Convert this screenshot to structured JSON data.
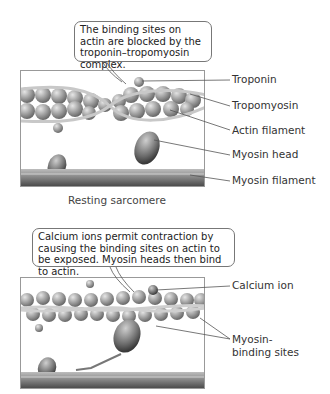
{
  "panels": [
    {
      "bubble_text": "The binding sites on actin are blocked by the troponin–tropomyosin complex.",
      "caption": "Resting sarcomere",
      "labels": [
        "Troponin",
        "Tropomyosin",
        "Actin filament",
        "Myosin head",
        "Myosin filament"
      ]
    },
    {
      "bubble_text": "Calcium ions permit contraction by causing the binding sites on actin to be exposed. Myosin heads then bind to actin.",
      "labels": [
        "Calcium ion",
        "Myosin-binding sites"
      ]
    }
  ],
  "colors": {
    "actin": "#9a9a9a",
    "myosin_filament": "#6f6f6f",
    "leader_line": "#555555"
  }
}
